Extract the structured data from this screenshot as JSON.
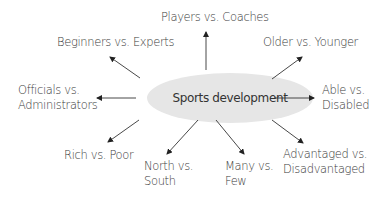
{
  "diagram": {
    "type": "radial-mind-map",
    "center": {
      "label": "Sports development",
      "fill": "#e6e6e6"
    },
    "arrow_color": "#222222",
    "nodes": [
      {
        "id": "players-coaches",
        "lines": [
          "Players vs. Coaches"
        ],
        "direction": "up"
      },
      {
        "id": "beginners-experts",
        "lines": [
          "Beginners vs. Experts"
        ],
        "direction": "up-left"
      },
      {
        "id": "older-younger",
        "lines": [
          "Older vs. Younger"
        ],
        "direction": "up-right"
      },
      {
        "id": "officials-administrators",
        "lines": [
          "Officials vs.",
          "Administrators"
        ],
        "direction": "left"
      },
      {
        "id": "able-disabled",
        "lines": [
          "Able vs.",
          "Disabled"
        ],
        "direction": "right"
      },
      {
        "id": "rich-poor",
        "lines": [
          "Rich vs. Poor"
        ],
        "direction": "down-left"
      },
      {
        "id": "north-south",
        "lines": [
          "North vs.",
          "South"
        ],
        "direction": "down-left"
      },
      {
        "id": "many-few",
        "lines": [
          "Many vs.",
          "Few"
        ],
        "direction": "down-right"
      },
      {
        "id": "advantaged-disadvantaged",
        "lines": [
          "Advantaged vs.",
          "Disadvantaged"
        ],
        "direction": "down-right"
      }
    ]
  }
}
